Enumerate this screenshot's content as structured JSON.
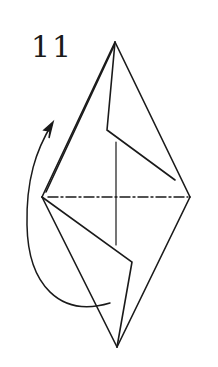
{
  "diagram": {
    "step_number": "11",
    "stroke_color": "#1a1a1a",
    "background": "#ffffff",
    "lines": {
      "fold_line_style": "dash-dot (mountain fold)",
      "arrow": "curved flip arrow (turn over)"
    }
  }
}
